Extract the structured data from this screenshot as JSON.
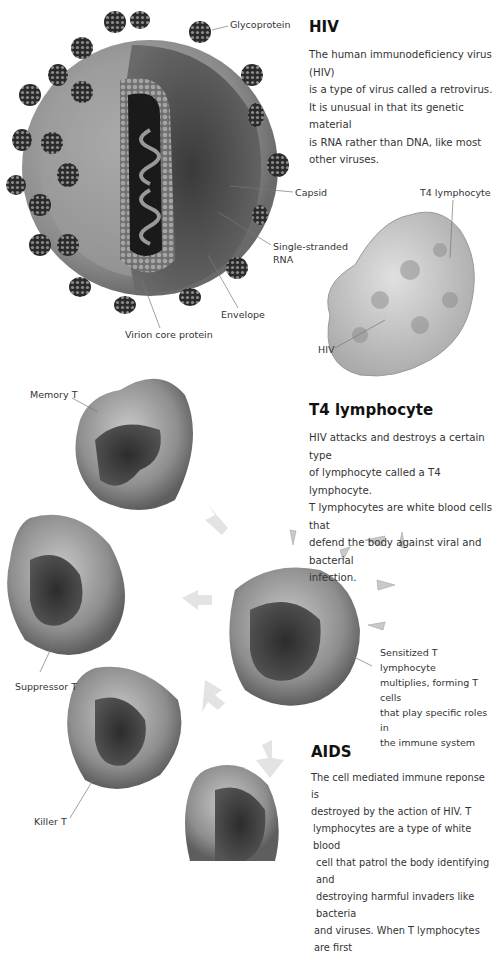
{
  "hiv_section": {
    "title": "HIV",
    "body": [
      "The human immunodeficiency virus (HIV)",
      "is a type of virus called a retrovirus.",
      "It is unusual in that its genetic material",
      "is RNA rather than DNA, like most",
      "other viruses."
    ]
  },
  "virus_diagram": {
    "labels": {
      "glycoprotein": "Glycoprotein",
      "capsid": "Capsid",
      "rna_line1": "Single-stranded",
      "rna_line2": "RNA",
      "envelope": "Envelope",
      "virion_core": "Virion core protein"
    }
  },
  "t4_diagram": {
    "labels": {
      "t4": "T4 lymphocyte",
      "hiv": "HIV"
    }
  },
  "t4_section": {
    "title": "T4 lymphocyte",
    "body": [
      "HIV attacks and destroys a certain type",
      "of lymphocyte called a T4 lymphocyte.",
      "T lymphocytes are white blood cells that",
      "defend the body against viral and bacterial",
      "infection."
    ]
  },
  "cells_diagram": {
    "labels": {
      "memory": "Memory T",
      "suppressor": "Suppressor T",
      "killer": "Killer T"
    },
    "sensitized": [
      "Sensitized T lymphocyte",
      "multiplies, forming T cells",
      "that play specific roles in",
      "the immune system"
    ]
  },
  "aids_section": {
    "title": "AIDS",
    "body": [
      "The cell mediated immune reponse is",
      "destroyed by the action of HIV. T",
      "lymphocytes are a type of white blood",
      "cell that patrol the body identifying and",
      "destroying harmful invaders like bacteria",
      "and viruses. When T lymphocytes are first"
    ]
  },
  "colors": {
    "background": "#ffffff",
    "text": "#333333",
    "heading": "#111111"
  }
}
